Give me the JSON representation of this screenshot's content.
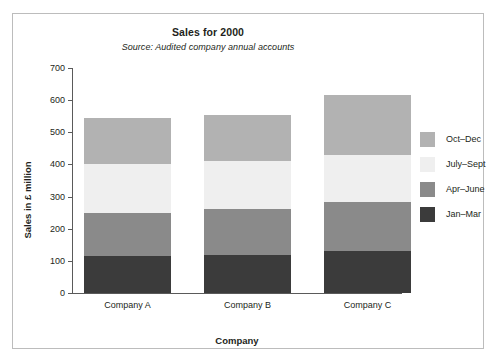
{
  "chart_data": {
    "type": "bar",
    "subtype": "stacked-bar",
    "title": "Sales for 2000",
    "subtitle": "Source: Audited company annual accounts",
    "xlabel": "Company",
    "ylabel": "Sales in £ million",
    "categories": [
      "Company A",
      "Company B",
      "Company C"
    ],
    "ylim": [
      0,
      700
    ],
    "yticks": [
      0,
      100,
      200,
      300,
      400,
      500,
      600,
      700
    ],
    "ytick_labels": [
      "0",
      "100",
      "200",
      "300",
      "400",
      "500",
      "600",
      "700"
    ],
    "grid": false,
    "legend_position": "right",
    "stack_order_bottom_to_top": [
      "Jan–Mar",
      "Apr–June",
      "July–Sept",
      "Oct–Dec"
    ],
    "series": [
      {
        "name": "Jan–Mar",
        "color": "#3b3b3b",
        "values": [
          115,
          118,
          130
        ]
      },
      {
        "name": "Apr–June",
        "color": "#8a8a8a",
        "values": [
          135,
          142,
          152
        ]
      },
      {
        "name": "July–Sept",
        "color": "#efefef",
        "values": [
          150,
          150,
          148
        ]
      },
      {
        "name": "Oct–Dec",
        "color": "#b2b2b2",
        "values": [
          145,
          145,
          185
        ]
      }
    ],
    "cumulative_tops": {
      "Company A": {
        "Jan–Mar": 115,
        "Apr–June": 250,
        "July–Sept": 400,
        "Oct–Dec": 545
      },
      "Company B": {
        "Jan–Mar": 118,
        "Apr–June": 260,
        "July–Sept": 410,
        "Oct–Dec": 555
      },
      "Company C": {
        "Jan–Mar": 130,
        "Apr–June": 282,
        "July–Sept": 430,
        "Oct–Dec": 615
      }
    },
    "totals": [
      545,
      555,
      615
    ],
    "legend_entries": [
      {
        "label": "Oct–Dec",
        "color": "#b2b2b2"
      },
      {
        "label": "July–Sept",
        "color": "#efefef"
      },
      {
        "label": "Apr–June",
        "color": "#8a8a8a"
      },
      {
        "label": "Jan–Mar",
        "color": "#3b3b3b"
      }
    ]
  }
}
